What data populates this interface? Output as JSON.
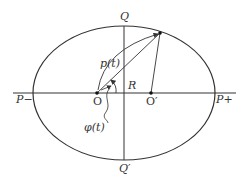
{
  "diagram": {
    "title": "",
    "labels": {
      "q_top": "Q",
      "q_bottom": "Q′",
      "p_minus": "P−",
      "p_plus": "P+",
      "r": "R",
      "o": "O",
      "o_prime": "O′",
      "p_t": "p(t)",
      "phi_t": "φ(t)"
    },
    "ellipse": {
      "cx": 124,
      "cy": 93,
      "rx": 91,
      "ry": 67
    },
    "points": {
      "O": [
        97,
        93
      ],
      "O_prime": [
        151,
        93
      ],
      "orbit_point": [
        160,
        32
      ]
    },
    "colors": {
      "stroke": "#333333",
      "background": "#ffffff"
    }
  }
}
